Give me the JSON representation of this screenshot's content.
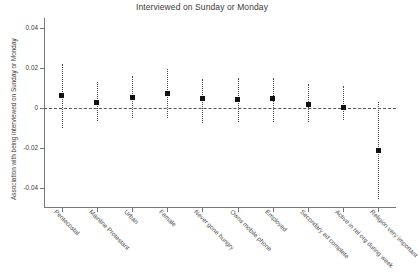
{
  "chart_data": {
    "type": "scatter",
    "title": "Interviewed on Sunday or Monday",
    "xlabel": "",
    "ylabel": "Association with being interviewed on Sunday or Monday",
    "ylim": [
      -0.05,
      0.045
    ],
    "yticks": [
      0.04,
      0.02,
      0,
      -0.02,
      -0.04
    ],
    "ytick_labels": [
      "0.04",
      "0.02",
      "0",
      "-0.02",
      "-0.04"
    ],
    "grid": false,
    "legend": "none",
    "reference_line": {
      "value": 0,
      "style": "dashed"
    },
    "categories": [
      "Pentecostal",
      "Mainline Protestant",
      "Urban",
      "Female",
      "Never gone hungry",
      "Owns mobile phone",
      "Employed",
      "Secondary ed complete",
      "Active in rel org during week",
      "Religion very important"
    ],
    "values": [
      0.0063,
      0.003,
      0.0052,
      0.0072,
      0.0047,
      0.0041,
      0.0046,
      0.002,
      0.0003,
      -0.0212
    ],
    "ci_low": [
      -0.01,
      -0.0065,
      -0.0052,
      -0.0052,
      -0.0075,
      -0.0072,
      -0.007,
      -0.007,
      -0.006,
      -0.0455
    ],
    "ci_high": [
      0.0222,
      0.0131,
      0.016,
      0.0197,
      0.0145,
      0.0152,
      0.0152,
      0.0122,
      0.0108,
      0.003
    ]
  }
}
